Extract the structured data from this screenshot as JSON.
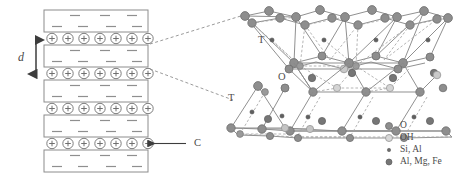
{
  "figure": {
    "width": 461,
    "height": 176
  },
  "stack": {
    "label_d": "d",
    "label_c": "C",
    "platelet_count": 5,
    "cation_rows": 4,
    "cations_per_row": 7,
    "cation_symbol": "+",
    "platelet_charge_symbol": "–",
    "minus_top_row_count": 3,
    "minus_bottom_row_count": 4,
    "platelet_fill": "#ffffff",
    "platelet_stroke": "#8c8c8c",
    "cation_stroke": "#7d7d7d"
  },
  "structure": {
    "label_t_upper": "T",
    "label_o_middle": "O",
    "label_t_lower": "T",
    "bond_color": "#8a8a8a",
    "dash_color": "#9a9a9a"
  },
  "legend": {
    "items": [
      {
        "label": "O",
        "marker": "atom-o-marker",
        "fill": "#8e8e8e",
        "stroke": "#6f6f6f",
        "size": 7.0
      },
      {
        "label": "OH",
        "marker": "atom-oh-marker",
        "fill": "#d9d9d9",
        "stroke": "#9a9a9a",
        "size": 7.0
      },
      {
        "label": "Si, Al",
        "marker": "atom-si-al-marker",
        "fill": "#6b6b6b",
        "stroke": "#5a5a5a",
        "size": 3.4
      },
      {
        "label": "Al, Mg, Fe",
        "marker": "atom-al-mg-fe-marker",
        "fill": "#767676",
        "stroke": "#5d5d5d",
        "size": 6.0
      }
    ]
  },
  "connectors": {
    "count": 2,
    "style": "dashed"
  }
}
